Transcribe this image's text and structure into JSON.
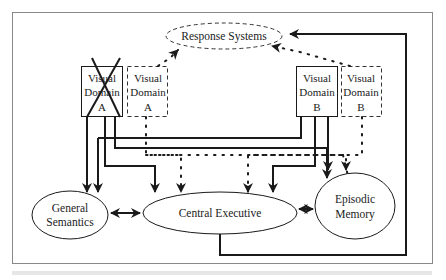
{
  "diagram": {
    "nodes": {
      "response_systems": {
        "label": "Response Systems",
        "style": "dashed-ellipse"
      },
      "visual_domain_a": {
        "line1": "Visual",
        "line2": "Domain",
        "line3": "A",
        "style": "solid-box-crossed-out"
      },
      "visual_domain_a_alt": {
        "line1": "Visual",
        "line2": "Domain",
        "line3": "A",
        "style": "dashed-box"
      },
      "visual_domain_b": {
        "line1": "Visual",
        "line2": "Domain",
        "line3": "B",
        "style": "solid-box"
      },
      "visual_domain_b_alt": {
        "line1": "Visual",
        "line2": "Domain",
        "line3": "B",
        "style": "dashed-box"
      },
      "general_semantics": {
        "line1": "General",
        "line2": "Semantics",
        "style": "ellipse"
      },
      "central_executive": {
        "label": "Central Executive",
        "style": "ellipse"
      },
      "episodic_memory": {
        "line1": "Episodic",
        "line2": "Memory",
        "style": "ellipse"
      }
    },
    "edges": [
      {
        "from": "visual_domain_a",
        "to": "general_semantics",
        "style": "solid"
      },
      {
        "from": "visual_domain_a",
        "to": "central_executive",
        "style": "solid"
      },
      {
        "from": "visual_domain_a",
        "to": "episodic_memory",
        "style": "solid"
      },
      {
        "from": "visual_domain_a_alt",
        "to": "response_systems",
        "style": "dotted"
      },
      {
        "from": "visual_domain_a_alt",
        "to": "central_executive",
        "style": "dotted"
      },
      {
        "from": "visual_domain_a_alt",
        "to": "episodic_memory",
        "style": "dotted"
      },
      {
        "from": "visual_domain_b",
        "to": "general_semantics",
        "style": "solid"
      },
      {
        "from": "visual_domain_b",
        "to": "central_executive",
        "style": "solid"
      },
      {
        "from": "visual_domain_b",
        "to": "episodic_memory",
        "style": "solid"
      },
      {
        "from": "visual_domain_b_alt",
        "to": "response_systems",
        "style": "dotted"
      },
      {
        "from": "visual_domain_b_alt",
        "to": "central_executive",
        "style": "dotted"
      },
      {
        "from": "central_executive",
        "to": "response_systems",
        "style": "solid"
      },
      {
        "from": "general_semantics",
        "to": "central_executive",
        "style": "bidirectional"
      },
      {
        "from": "central_executive",
        "to": "episodic_memory",
        "style": "bidirectional"
      }
    ]
  },
  "colors": {
    "stroke": "#1a1a1a",
    "frame": "#888888",
    "background": "#ffffff"
  }
}
